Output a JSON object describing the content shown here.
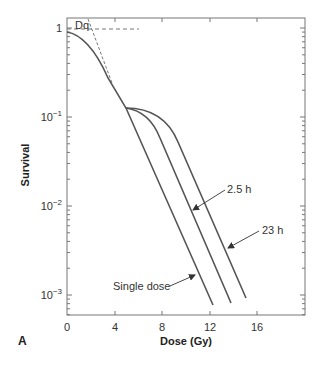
{
  "chart_data": {
    "type": "line",
    "panel_label": "A",
    "title": "",
    "xlabel": "Dose (Gy)",
    "ylabel": "Survival",
    "xlim": [
      0,
      20
    ],
    "ylim": [
      0.0006,
      1.6
    ],
    "yscale": "log",
    "grid": false,
    "legend": "none (inline arrow annotations)",
    "x_ticks": [
      0,
      4,
      8,
      12,
      16
    ],
    "x_tick_labels": [
      "0",
      "4",
      "8",
      "12",
      "16"
    ],
    "y_ticks": [
      1,
      0.1,
      0.01,
      0.001
    ],
    "y_tick_labels": [
      "1",
      "10−1",
      "10−2",
      "10−3"
    ],
    "series": [
      {
        "name": "Single dose",
        "x": [
          0,
          1,
          2,
          3,
          4,
          5,
          6,
          8,
          10,
          12.3
        ],
        "y": [
          0.9,
          0.83,
          0.64,
          0.42,
          0.23,
          0.125,
          0.066,
          0.0185,
          0.0053,
          0.00078
        ]
      },
      {
        "name": "2.5 h",
        "x": [
          5,
          6,
          7,
          8,
          10,
          12,
          13.8
        ],
        "y": [
          0.125,
          0.11,
          0.075,
          0.04,
          0.011,
          0.0032,
          0.00081
        ]
      },
      {
        "name": "23 h",
        "x": [
          5,
          6,
          7,
          8,
          9,
          11,
          13,
          15
        ],
        "y": [
          0.125,
          0.12,
          0.105,
          0.075,
          0.042,
          0.012,
          0.0037,
          0.00093
        ]
      }
    ],
    "annotations": [
      {
        "text": "Dq",
        "note": "quasi-threshold dose; dashed extrapolation of straight portion back to survival = 1"
      },
      {
        "text": "2.5 h",
        "points_to": "2.5 h"
      },
      {
        "text": "23 h",
        "points_to": "23 h"
      },
      {
        "text": "Single dose",
        "points_to": "Single dose"
      }
    ]
  },
  "labels": {
    "panel": "A",
    "xlabel": "Dose (Gy)",
    "ylabel": "Survival",
    "dq": "Dq",
    "ann_2_5h": "2.5 h",
    "ann_23h": "23 h",
    "ann_single": "Single dose",
    "xt0": "0",
    "xt4": "4",
    "xt8": "8",
    "xt12": "12",
    "xt16": "16",
    "yt0": "1",
    "yt1_base": "10",
    "yt1_exp": "−1",
    "yt2_base": "10",
    "yt2_exp": "−2",
    "yt3_base": "10",
    "yt3_exp": "−3"
  },
  "colors": {
    "curve": "#555555",
    "axis": "#666666",
    "dashed": "#666666",
    "text": "#333333"
  }
}
